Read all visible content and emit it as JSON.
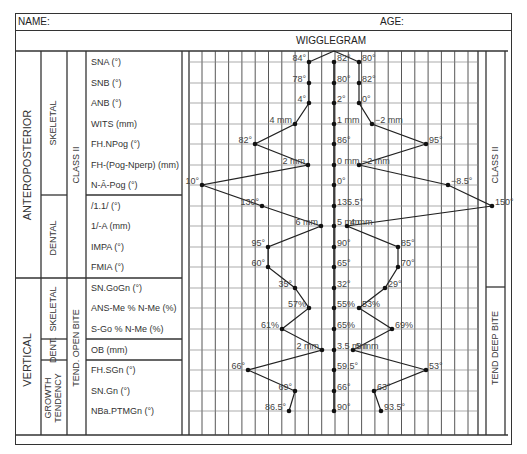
{
  "header": {
    "name_label": "NAME:",
    "age_label": "AGE:"
  },
  "title": "WIGGLEGRAM",
  "groups": {
    "anteroposterior": "ANTEROPOSTERIOR",
    "vertical": "VERTICAL",
    "skeletal_ap": "SKELETAL",
    "dental_ap": "DENTAL",
    "skeletal_v": "SKELETAL",
    "dental_v": "DENT.",
    "growth": "GROWTH TENDENCY",
    "class_ii_left": "CLASS II",
    "open_bite": "TEND. OPEN BITE",
    "class_ii_right": "CLASS II",
    "deep_bite": "TEND DEEP BITE"
  },
  "rows": [
    {
      "label": "SNA (°)",
      "left": "84°",
      "mid": "82°",
      "right": "80°"
    },
    {
      "label": "SNB (°)",
      "left": "78°",
      "mid": "80°",
      "right": "82°"
    },
    {
      "label": "ANB (°)",
      "left": "4°",
      "mid": "2°",
      "right": "0°"
    },
    {
      "label": "WITS (mm)",
      "left": "4 mm",
      "mid": "1 mm",
      "right": "−2 mm"
    },
    {
      "label": "FH.NPog (°)",
      "left": "82°",
      "mid": "86°",
      "right": "95°"
    },
    {
      "label": "FH-(Pog-Nperp) (mm)",
      "left": "2 mm",
      "mid": "0 mm",
      "right": "−2 mm"
    },
    {
      "label": "N-Â-Pog (°)",
      "left": "10°",
      "mid": "0°",
      "right": "−8.5°"
    },
    {
      "label": "/1.1/ (°)",
      "left": "130°",
      "mid": "135.5°",
      "right": "150°"
    },
    {
      "label": "1/-A (mm)",
      "left": "6 mm",
      "mid": "5 mm",
      "right": "4 mm"
    },
    {
      "label": "IMPA (°)",
      "left": "95°",
      "mid": "90°",
      "right": "85°"
    },
    {
      "label": "FMIA (°)",
      "left": "60°",
      "mid": "65°",
      "right": "70°"
    },
    {
      "label": "SN.GoGn (°)",
      "left": "35°",
      "mid": "32°",
      "right": "29°"
    },
    {
      "label": "ANS-Me % N-Me (%)",
      "left": "57%",
      "mid": "55%",
      "right": "53%"
    },
    {
      "label": "S-Go % N-Me (%)",
      "left": "61%",
      "mid": "65%",
      "right": "69%"
    },
    {
      "label": "OB (mm)",
      "left": "2 mm",
      "mid": "3.5 mm",
      "right": "5 mm"
    },
    {
      "label": "FH.SGn (°)",
      "left": "66°",
      "mid": "59.5°",
      "right": "53°"
    },
    {
      "label": "SN.Gn (°)",
      "left": "69°",
      "mid": "66°",
      "right": "63°"
    },
    {
      "label": "NBa.PTMGn (°)",
      "left": "86.5°",
      "mid": "90°",
      "right": "93.5°"
    }
  ]
}
